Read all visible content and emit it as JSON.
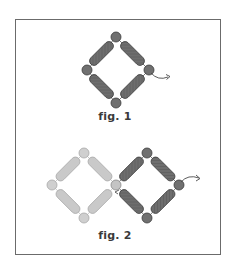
{
  "figures": [
    {
      "caption": "fig. 1",
      "description": "Four dark bugle beads joined by four dark round beads in a diamond; thread exits right bead with arrow"
    },
    {
      "caption": "fig. 2",
      "description": "Light (previous) diamond on left shares a round bead with new dark diamond on right; thread exits right with arrow"
    }
  ],
  "colors": {
    "frame": "#6b6b6b",
    "dark_bead": "#6e6e6e",
    "dark_bead_stroke": "#3c3c3c",
    "light_bead": "#c9c9c9",
    "light_bead_stroke": "#a8a8a8",
    "thread": "#4a4a4a",
    "caption": "#3a3a3a"
  }
}
